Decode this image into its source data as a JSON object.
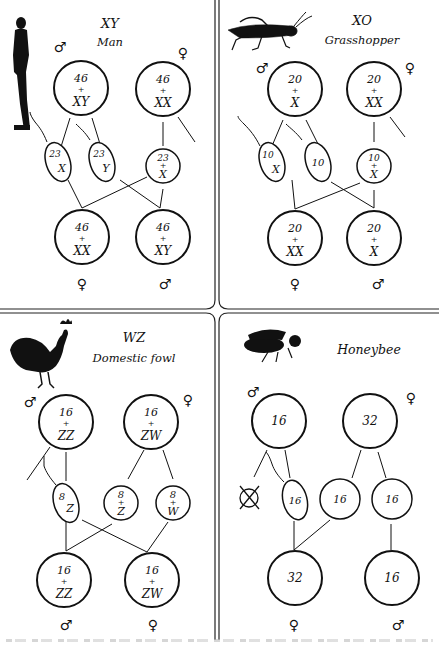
{
  "figure": {
    "panels": [
      {
        "id": "man",
        "system": "XY",
        "organism": "Man",
        "icon": "human-figure-icon",
        "parents": [
          {
            "sex": "male",
            "symbol": "♂",
            "num": "46",
            "chr": "XY"
          },
          {
            "sex": "female",
            "symbol": "♀",
            "num": "46",
            "chr": "XX"
          }
        ],
        "gametes": [
          {
            "type": "sperm",
            "num": "23",
            "chr": "X"
          },
          {
            "type": "sperm",
            "num": "23",
            "chr": "Y"
          },
          {
            "type": "egg",
            "num": "23",
            "chr": "X"
          }
        ],
        "offspring": [
          {
            "sex": "female",
            "symbol": "♀",
            "num": "46",
            "chr": "XX"
          },
          {
            "sex": "male",
            "symbol": "♂",
            "num": "46",
            "chr": "XY"
          }
        ]
      },
      {
        "id": "grasshopper",
        "system": "XO",
        "organism": "Grasshopper",
        "icon": "grasshopper-icon",
        "parents": [
          {
            "sex": "male",
            "symbol": "♂",
            "num": "20",
            "chr": "X"
          },
          {
            "sex": "female",
            "symbol": "♀",
            "num": "20",
            "chr": "XX"
          }
        ],
        "gametes": [
          {
            "type": "sperm",
            "num": "10",
            "chr": "X"
          },
          {
            "type": "sperm",
            "num": "10",
            "chr": ""
          },
          {
            "type": "egg",
            "num": "10",
            "chr": "X"
          }
        ],
        "offspring": [
          {
            "sex": "female",
            "symbol": "♀",
            "num": "20",
            "chr": "XX"
          },
          {
            "sex": "male",
            "symbol": "♂",
            "num": "20",
            "chr": "X"
          }
        ]
      },
      {
        "id": "fowl",
        "system": "WZ",
        "organism": "Domestic fowl",
        "icon": "rooster-icon",
        "parents": [
          {
            "sex": "male",
            "symbol": "♂",
            "num": "16",
            "chr": "ZZ"
          },
          {
            "sex": "female",
            "symbol": "♀",
            "num": "16",
            "chr": "ZW"
          }
        ],
        "gametes": [
          {
            "type": "sperm",
            "num": "8",
            "chr": "Z"
          },
          {
            "type": "egg",
            "num": "8",
            "chr": "Z"
          },
          {
            "type": "egg",
            "num": "8",
            "chr": "W"
          }
        ],
        "offspring": [
          {
            "sex": "male",
            "symbol": "♂",
            "num": "16",
            "chr": "ZZ"
          },
          {
            "sex": "female",
            "symbol": "♀",
            "num": "16",
            "chr": "ZW"
          }
        ]
      },
      {
        "id": "honeybee",
        "system": "",
        "organism": "Honeybee",
        "icon": "honeybee-icon",
        "parents": [
          {
            "sex": "male",
            "symbol": "♂",
            "num": "16",
            "chr": ""
          },
          {
            "sex": "female",
            "symbol": "♀",
            "num": "32",
            "chr": ""
          }
        ],
        "gametes": [
          {
            "type": "degenerate",
            "num": "",
            "chr": ""
          },
          {
            "type": "sperm",
            "num": "16",
            "chr": ""
          },
          {
            "type": "egg",
            "num": "16",
            "chr": ""
          },
          {
            "type": "egg",
            "num": "16",
            "chr": ""
          }
        ],
        "offspring": [
          {
            "sex": "female",
            "symbol": "♀",
            "num": "32",
            "chr": ""
          },
          {
            "sex": "male",
            "symbol": "♂",
            "num": "16",
            "chr": ""
          }
        ]
      }
    ],
    "plus": "+",
    "colors": {
      "ink": "#111111",
      "paper": "#ffffff",
      "divider": "#222222"
    }
  }
}
